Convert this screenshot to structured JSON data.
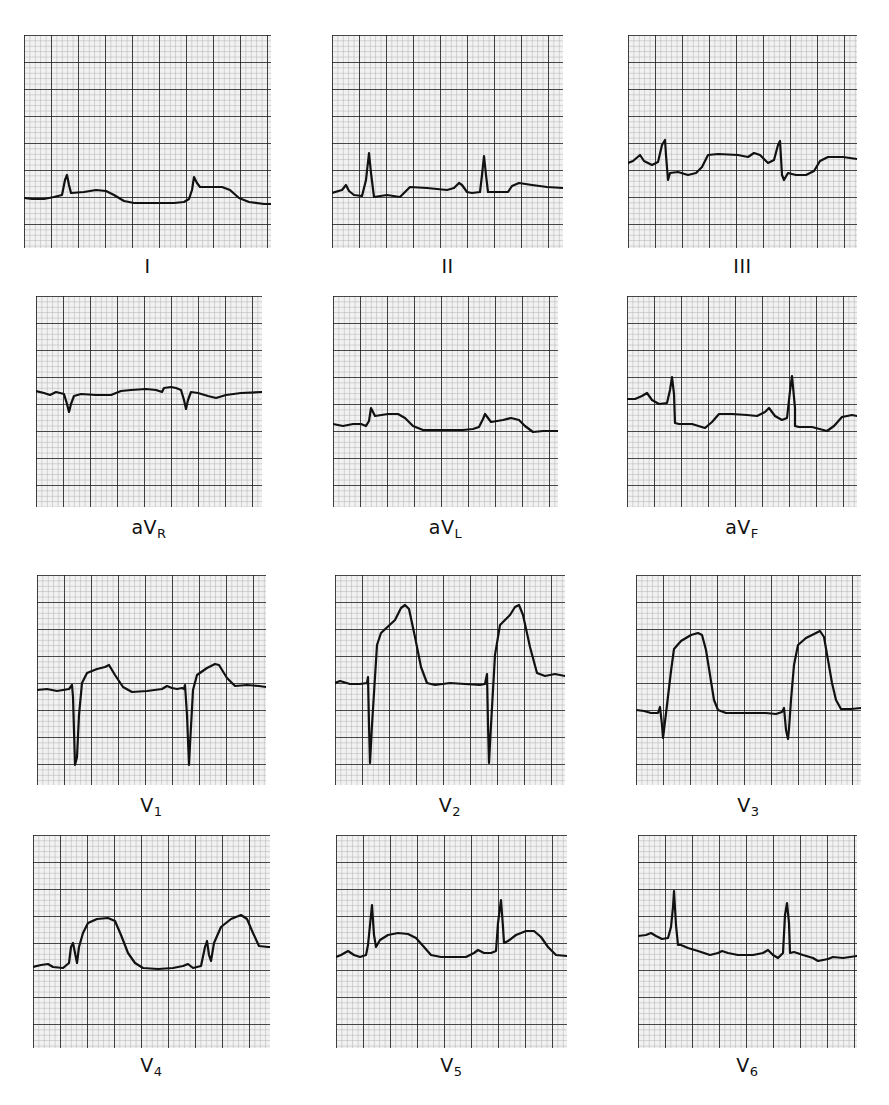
{
  "figure": {
    "colors": {
      "paper": "#f2f2f2",
      "minor_grid": "#a8a8a8",
      "major_grid": "#1a1a1a",
      "trace": "#111111"
    },
    "grid": {
      "major_px": 27,
      "minor_per_major": 5
    }
  },
  "leads": [
    {
      "id": "I",
      "label": "I",
      "sub": "",
      "x": 24,
      "y": 35,
      "w": 247,
      "h": 213,
      "label_y": 255,
      "trace": "0,163 8,164 20,164 30,162 38,160 41,145 43,140 45,150 47,158 60,157 72,155 82,156 90,160 100,166 110,168 130,168 150,168 160,167 165,164 168,155 170,142 173,148 176,152 190,152 198,152 206,155 215,163 225,167 240,169 247,169"
    },
    {
      "id": "II",
      "label": "II",
      "sub": "",
      "x": 332,
      "y": 35,
      "w": 231,
      "h": 213,
      "label_y": 255,
      "trace": "0,158 10,155 14,150 17,156 22,160 30,161 34,145 37,118 39,138 42,162 55,160 68,162 72,158 78,152 95,153 115,155 122,153 127,148 130,150 135,157 140,158 148,157 150,140 152,121 154,140 156,157 170,157 176,157 180,151 187,148 200,150 215,152 231,153"
    },
    {
      "id": "III",
      "label": "III",
      "sub": "",
      "x": 628,
      "y": 35,
      "w": 229,
      "h": 213,
      "label_y": 255,
      "trace": "0,128 5,126 12,120 16,126 24,130 30,127 34,110 37,105 38,120 40,145 42,138 50,137 60,140 68,138 74,132 80,120 90,119 110,120 120,122 126,118 132,120 140,128 146,125 150,110 152,106 154,140 156,145 160,138 168,140 178,140 186,136 192,126 200,122 215,122 229,124"
    },
    {
      "id": "aVR",
      "label": "aV",
      "sub": "R",
      "x": 36,
      "y": 296,
      "w": 226,
      "h": 211,
      "label_y": 516,
      "trace": "0,95 8,97 14,99 20,96 28,98 31,108 33,116 35,108 38,100 45,98 60,99 75,99 85,95 95,94 110,93 120,94 126,96 128,92 135,91 140,92 145,94 148,104 150,113 152,104 155,96 162,97 172,100 180,102 190,99 205,97 226,96"
    },
    {
      "id": "aVL",
      "label": "aV",
      "sub": "L",
      "x": 333,
      "y": 296,
      "w": 225,
      "h": 211,
      "label_y": 516,
      "trace": "0,128 10,130 20,128 28,128 33,130 36,125 38,112 40,116 42,120 55,118 65,118 72,122 80,130 90,134 110,134 130,134 140,133 146,131 150,123 152,118 155,122 158,126 170,124 178,122 186,124 192,130 200,136 210,135 225,135"
    },
    {
      "id": "aVF",
      "label": "aV",
      "sub": "F",
      "x": 627,
      "y": 296,
      "w": 230,
      "h": 211,
      "label_y": 516,
      "trace": "0,103 8,103 15,100 20,97 25,104 32,108 40,107 43,94 45,81 47,98 48,127 52,128 65,128 78,132 85,126 92,118 105,118 120,119 130,120 138,116 142,112 148,120 155,124 160,122 163,95 165,80 168,112 168,130 172,131 185,131 200,135 207,130 215,121 225,119 230,120"
    },
    {
      "id": "V1",
      "label": "V",
      "sub": "1",
      "x": 37,
      "y": 575,
      "w": 229,
      "h": 210,
      "label_y": 794,
      "trace": "0,115 10,114 20,116 32,114 35,110 36,122 38,190 40,182 42,140 45,108 50,98 60,94 68,92 72,90 78,100 86,112 95,117 110,116 125,114 130,111 135,113 140,114 145,113 147,114 148,110 150,140 152,190 153,170 156,115 160,100 170,93 178,89 182,90 190,103 198,111 210,110 222,111 229,112"
    },
    {
      "id": "V2",
      "label": "V",
      "sub": "2",
      "x": 335,
      "y": 575,
      "w": 230,
      "h": 210,
      "label_y": 794,
      "trace": "0,108 5,106 15,109 25,109 32,108 33,102 34,150 35,188 37,150 42,70 46,58 60,45 66,33 70,30 74,34 80,62 86,92 92,108 100,110 115,108 130,109 145,110 150,109 152,99 153,150 154,188 156,150 160,80 165,50 175,40 180,32 184,30 188,40 195,72 202,98 210,101 220,99 230,101"
    },
    {
      "id": "V3",
      "label": "V",
      "sub": "3",
      "x": 636,
      "y": 575,
      "w": 225,
      "h": 210,
      "label_y": 794,
      "trace": "0,135 8,136 15,138 22,138 24,132 26,150 27,163 28,155 31,130 35,96 38,74 45,66 55,60 62,58 66,60 70,75 74,100 78,125 82,135 90,138 110,138 130,138 140,139 146,137 148,133 150,155 152,164 153,154 155,125 158,90 162,70 170,63 178,59 184,56 188,62 192,85 196,108 200,125 205,134 215,134 225,133"
    },
    {
      "id": "V4",
      "label": "V",
      "sub": "4",
      "x": 33,
      "y": 835,
      "w": 237,
      "h": 213,
      "label_y": 1054,
      "trace": "0,132 8,130 15,129 20,132 30,133 36,128 38,112 40,108 42,118 44,128 46,112 50,98 55,88 64,84 75,83 82,86 88,100 95,118 102,128 110,133 125,134 140,133 150,131 155,129 160,133 168,131 172,112 174,106 176,120 178,126 181,108 188,92 198,84 208,80 214,84 220,98 226,111 235,112 237,112"
    },
    {
      "id": "V5",
      "label": "V",
      "sub": "5",
      "x": 336,
      "y": 835,
      "w": 231,
      "h": 213,
      "label_y": 1054,
      "trace": "0,122 5,120 12,116 18,120 24,122 30,120 32,110 34,90 36,70 38,100 40,112 44,105 52,100 62,98 72,99 80,103 88,112 95,120 105,122 120,122 130,122 138,118 142,115 148,118 155,118 160,116 162,88 165,65 167,92 168,108 172,106 180,100 190,96 198,96 205,102 212,112 220,120 231,121"
    },
    {
      "id": "V6",
      "label": "V",
      "sub": "6",
      "x": 638,
      "y": 835,
      "w": 219,
      "h": 213,
      "label_y": 1054,
      "trace": "0,101 8,100 13,98 18,101 24,104 30,103 33,92 35,72 36,56 38,90 40,110 43,110 50,113 60,116 72,120 80,118 84,116 90,118 100,120 115,120 125,118 130,115 135,120 140,123 145,118 147,80 149,68 151,88 152,118 156,117 165,120 175,123 180,126 190,124 195,122 205,123 219,121"
    }
  ]
}
